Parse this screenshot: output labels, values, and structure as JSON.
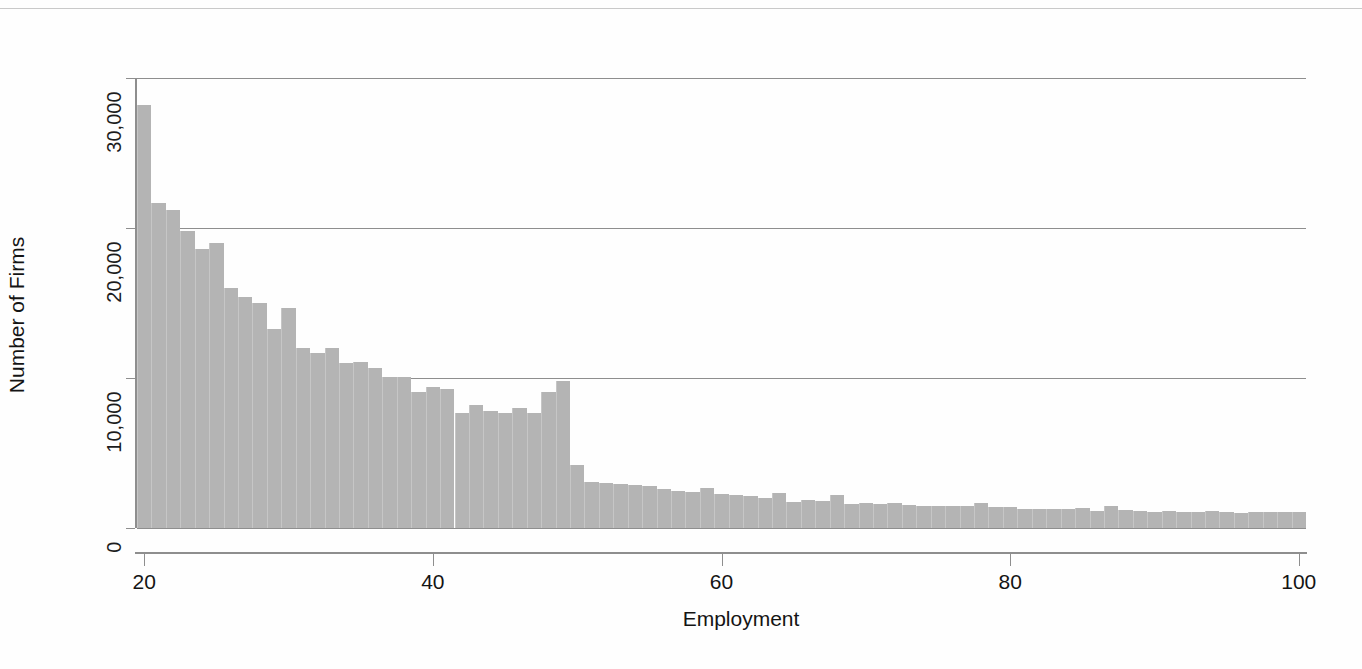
{
  "chart_data": {
    "type": "bar",
    "title": "",
    "subtitle": "",
    "xlabel": "Employment",
    "ylabel": "Number of Firms",
    "xlim": [
      19.5,
      100.5
    ],
    "ylim": [
      0,
      30000
    ],
    "xticks": [
      "20",
      "40",
      "60",
      "80",
      "100"
    ],
    "xtick_values": [
      20,
      40,
      60,
      80,
      100
    ],
    "yticks": [
      "0",
      "10,000",
      "20,000",
      "30,000"
    ],
    "ytick_values": [
      0,
      10000,
      20000,
      30000
    ],
    "grid": "horizontal",
    "legend": null,
    "bar_color": "#b4b4b4",
    "axis_color": "#8e8e8e",
    "bin_width": 1,
    "annotations": [],
    "categories": [
      20,
      21,
      22,
      23,
      24,
      25,
      26,
      27,
      28,
      29,
      30,
      31,
      32,
      33,
      34,
      35,
      36,
      37,
      38,
      39,
      40,
      41,
      42,
      43,
      44,
      45,
      46,
      47,
      48,
      49,
      50,
      51,
      52,
      53,
      54,
      55,
      56,
      57,
      58,
      59,
      60,
      61,
      62,
      63,
      64,
      65,
      66,
      67,
      68,
      69,
      70,
      71,
      72,
      73,
      74,
      75,
      76,
      77,
      78,
      79,
      80,
      81,
      82,
      83,
      84,
      85,
      86,
      87,
      88,
      89,
      90,
      91,
      92,
      93,
      94,
      95,
      96,
      97,
      98,
      99,
      100
    ],
    "values": [
      28200,
      21700,
      21200,
      19800,
      18600,
      19000,
      16000,
      15400,
      15000,
      13300,
      14700,
      12000,
      11700,
      12000,
      11000,
      11100,
      10700,
      10100,
      10100,
      9100,
      9400,
      9300,
      7700,
      8200,
      7800,
      7700,
      8000,
      7700,
      9100,
      9800,
      4200,
      3100,
      3000,
      2950,
      2900,
      2800,
      2600,
      2500,
      2400,
      2700,
      2250,
      2200,
      2150,
      2000,
      2350,
      1750,
      1900,
      1800,
      2200,
      1600,
      1700,
      1600,
      1700,
      1550,
      1500,
      1500,
      1450,
      1450,
      1700,
      1400,
      1400,
      1300,
      1300,
      1250,
      1250,
      1350,
      1150,
      1500,
      1200,
      1150,
      1100,
      1150,
      1100,
      1050,
      1150,
      1100,
      1000,
      1100,
      1050,
      1100,
      1050
    ]
  }
}
